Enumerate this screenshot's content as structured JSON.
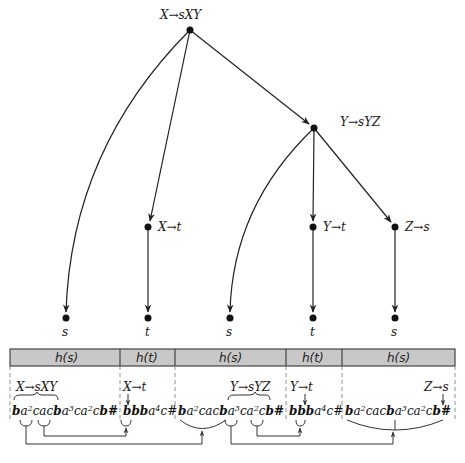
{
  "tree": {
    "nodes": [
      {
        "id": "root",
        "label": "X→sXY",
        "x": 190,
        "y": 30
      },
      {
        "id": "y_node",
        "label": "Y→sYZ",
        "x": 314,
        "y": 128
      },
      {
        "id": "x_t",
        "label": "X→t",
        "x": 148,
        "y": 227
      },
      {
        "id": "y_t",
        "label": "Y→t",
        "x": 313,
        "y": 227
      },
      {
        "id": "z_s",
        "label": "Z→s",
        "x": 395,
        "y": 227
      },
      {
        "id": "leaf1",
        "label": "s",
        "x": 66,
        "y": 318
      },
      {
        "id": "leaf2",
        "label": "t",
        "x": 148,
        "y": 318
      },
      {
        "id": "leaf3",
        "label": "s",
        "x": 230,
        "y": 318
      },
      {
        "id": "leaf4",
        "label": "t",
        "x": 313,
        "y": 318
      },
      {
        "id": "leaf5",
        "label": "s",
        "x": 395,
        "y": 318
      }
    ]
  },
  "header_bar": {
    "segments": [
      {
        "label": "h(s)",
        "x0": 10,
        "x1": 120
      },
      {
        "label": "h(t)",
        "x0": 120,
        "x1": 175
      },
      {
        "label": "h(s)",
        "x0": 175,
        "x1": 286
      },
      {
        "label": "h(t)",
        "x0": 286,
        "x1": 342
      },
      {
        "label": "h(s)",
        "x0": 342,
        "x1": 455
      }
    ],
    "fill": "#c8c8c8"
  },
  "annotations": {
    "a1": "X→sXY",
    "a2": "X→t",
    "a3": "Y→sYZ",
    "a4": "Y→t",
    "a5": "Z→s"
  },
  "strings": {
    "seg1": [
      "b",
      "a",
      "2",
      "cac",
      "b",
      "a",
      "3",
      "ca",
      "2",
      "c",
      "b#"
    ],
    "seg2": [
      "bbb",
      "a",
      "4",
      "c#"
    ],
    "seg3": [
      "b",
      "a",
      "2",
      "cac",
      "b",
      "a",
      "3",
      "ca",
      "2",
      "c",
      "b#"
    ],
    "seg4": [
      "bbb",
      "a",
      "4",
      "c#"
    ],
    "seg5": [
      "b",
      "a",
      "2",
      "cac",
      "b",
      "a",
      "3",
      "ca",
      "2",
      "c",
      "b#"
    ]
  }
}
